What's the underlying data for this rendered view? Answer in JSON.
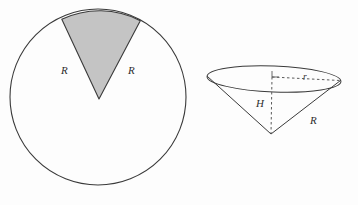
{
  "figure": {
    "background_color": "#fdfdfd",
    "stroke_color": "#3a3a3a",
    "shade_color": "#c4c4c4",
    "label_color": "#2e2e2e"
  },
  "left_figure": {
    "name": "circle-with-shaded-sector",
    "circle": {
      "cx": 98,
      "cy": 97,
      "r": 88
    },
    "sector": {
      "apex_x": 99,
      "apex_y": 99,
      "start_angle_deg": -115,
      "end_angle_deg": -62,
      "fill": "#c4c4c4"
    },
    "labels": {
      "radius_left": "R",
      "radius_right": "R"
    },
    "label_positions": {
      "radius_left_x": 61,
      "radius_left_y": 70,
      "radius_right_x": 130,
      "radius_right_y": 70
    }
  },
  "right_figure": {
    "name": "inverted-cone",
    "ellipse": {
      "cx": 274,
      "cy": 79,
      "rx": 67,
      "ry": 13
    },
    "apex": {
      "x": 271,
      "y": 134
    },
    "labels": {
      "height": "H",
      "radius_base": "r",
      "slant_radius": "R"
    },
    "label_positions": {
      "height_x": 261,
      "height_y": 104,
      "radius_base_x": 306,
      "radius_base_y": 80,
      "slant_radius_x": 313,
      "slant_radius_y": 120
    }
  }
}
